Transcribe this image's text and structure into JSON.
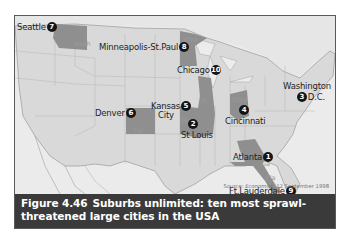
{
  "figure": {
    "number": "Figure 4.46",
    "caption_line1": "Suburbs unlimited: ten most sprawl-",
    "caption_line2": "threatened large cities in the USA",
    "source_prefix": "Source: ",
    "source_publication": "Economist",
    "source_date": ", 12 September 1998"
  },
  "colors": {
    "land": "#dcdcdc",
    "water": "#eeeeee",
    "highlight_state": "#8f8f8f",
    "state_border": "#b4b4b4",
    "badge": "#151515",
    "caption_bg": "#3a3a3a"
  },
  "cities": [
    {
      "rank": "1",
      "name": "Atlanta",
      "state": "Ga"
    },
    {
      "rank": "2",
      "name": "St Louis",
      "state": "Mo"
    },
    {
      "rank": "3",
      "name": "Washington D.C.",
      "line1": "Washington",
      "line2": "D.C.",
      "state": ""
    },
    {
      "rank": "4",
      "name": "Cincinnati",
      "state": "Ohio"
    },
    {
      "rank": "5",
      "name": "Kansas City",
      "line1": "Kansas",
      "line2": "City",
      "state": ""
    },
    {
      "rank": "6",
      "name": "Denver",
      "state": "Col"
    },
    {
      "rank": "7",
      "name": "Seattle",
      "state": "Wash"
    },
    {
      "rank": "8",
      "name": "Minneapolis-St.Paul",
      "state": "Minn"
    },
    {
      "rank": "9",
      "name": "Ft.Lauderdale",
      "state": "Fla"
    },
    {
      "rank": "10",
      "name": "Chicago",
      "state": "Ill"
    }
  ]
}
